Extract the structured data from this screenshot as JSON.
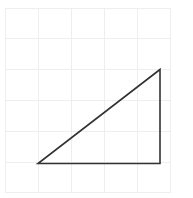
{
  "canvas": {
    "width": 193,
    "height": 198,
    "background": "#ffffff"
  },
  "grid": {
    "name": "square-grid",
    "line_color": "#eeeeee",
    "line_width": 1,
    "origin_x": 5,
    "origin_y": 8,
    "cell_width": 33,
    "cell_height": 30.8,
    "columns": 5,
    "rows": 6,
    "vertical_lines_x": [
      5,
      38,
      71,
      104,
      137,
      170
    ],
    "horizontal_lines_y": [
      8,
      38.8,
      69.6,
      100.4,
      131.2,
      162,
      192.8
    ],
    "visible": true
  },
  "chart_data": {
    "type": "diagram",
    "title": "",
    "shapes": [
      {
        "name": "right-triangle",
        "kind": "polygon",
        "closed": true,
        "stroke": "#333333",
        "stroke_width": 1.6,
        "fill": "none",
        "vertices": [
          {
            "label": "A",
            "x": 38,
            "y": 163.5
          },
          {
            "label": "B",
            "x": 160,
            "y": 163.5
          },
          {
            "label": "C",
            "x": 160,
            "y": 69.5
          }
        ],
        "edges": [
          {
            "name": "base",
            "from": "A",
            "to": "B",
            "orientation": "horizontal",
            "length_px": 122,
            "length_cells": 3.7
          },
          {
            "name": "vertical-leg",
            "from": "B",
            "to": "C",
            "orientation": "vertical",
            "length_px": 94,
            "length_cells": 3.05
          },
          {
            "name": "hypotenuse",
            "from": "C",
            "to": "A",
            "orientation": "diagonal",
            "length_px": 154,
            "length_cells": 4.8
          }
        ],
        "right_angle_at": "B"
      }
    ],
    "xlabel": "",
    "ylabel": "",
    "legend": [],
    "annotations": [],
    "grid": true
  },
  "accessibility": {
    "description": "A right triangle drawn with dark outline on a pale square grid background. The right angle is at the bottom-right vertex; the horizontal base runs along the lower grid line and the hypotenuse rises from lower-left to upper-right."
  }
}
